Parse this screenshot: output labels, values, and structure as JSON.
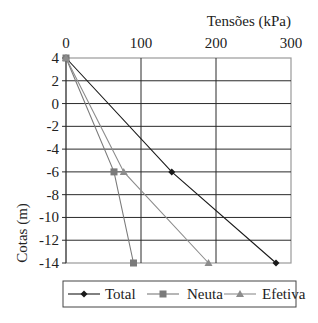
{
  "chart_data": {
    "type": "line",
    "title": "",
    "xlabel": "Tensões (kPa)",
    "ylabel": "Cotas (m)",
    "xlim": [
      0,
      300
    ],
    "ylim": [
      -14,
      4
    ],
    "x_ticks": [
      "0",
      "100",
      "200",
      "300"
    ],
    "y_ticks": [
      "4",
      "2",
      "0",
      "-2",
      "-4",
      "-6",
      "-8",
      "-10",
      "-12",
      "-14"
    ],
    "x_axis_position": "top",
    "grid": true,
    "legend_position": "bottom",
    "y": [
      4,
      -6,
      -14
    ],
    "series": [
      {
        "name": "Total",
        "marker": "diamond",
        "color": "#1a1a1a",
        "x": [
          0,
          141,
          280
        ],
        "y": [
          4,
          -6,
          -14
        ]
      },
      {
        "name": "Neuta",
        "marker": "square",
        "color": "#7a7a7a",
        "x": [
          0,
          64,
          90
        ],
        "y": [
          4,
          -6,
          -14
        ]
      },
      {
        "name": "Efetiva",
        "marker": "triangle",
        "color": "#8c8c8c",
        "x": [
          0,
          77,
          190
        ],
        "y": [
          4,
          -6,
          -14
        ]
      }
    ]
  },
  "legend": {
    "items": [
      "Total",
      "Neuta",
      "Efetiva"
    ]
  }
}
